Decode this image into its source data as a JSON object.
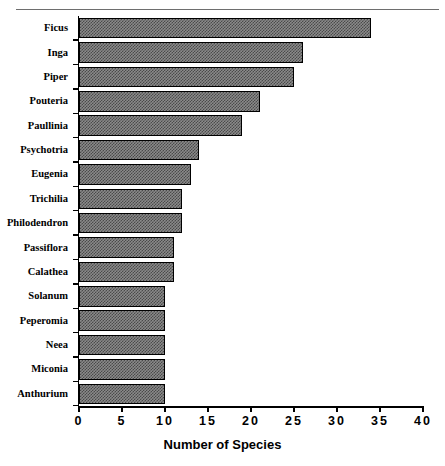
{
  "figure": {
    "top_ghost_text": "",
    "caption_ghost_text": ""
  },
  "chart_data": {
    "type": "bar",
    "orientation": "horizontal",
    "title": "",
    "xlabel": "Number of Species",
    "ylabel": "",
    "xlim": [
      0,
      40
    ],
    "xticks": [
      0,
      5,
      10,
      15,
      20,
      25,
      30,
      35,
      40
    ],
    "xtick_labels": [
      "0",
      "5",
      "10",
      "15",
      "20",
      "25",
      "30",
      "35",
      "40"
    ],
    "grid": false,
    "legend": null,
    "categories": [
      "Ficus",
      "Inga",
      "Piper",
      "Pouteria",
      "Paullinia",
      "Psychotria",
      "Eugenia",
      "Trichilia",
      "Philodendron",
      "Passiflora",
      "Calathea",
      "Solanum",
      "Peperomia",
      "Neea",
      "Miconia",
      "Anthurium"
    ],
    "values": [
      34,
      26,
      25,
      21,
      19,
      14,
      13,
      12,
      12,
      11,
      11,
      10,
      10,
      10,
      10,
      10
    ],
    "colors": {
      "bar_fill": "#8a8a8a",
      "bar_pattern": "#4a4a4a",
      "bar_border": "#000000",
      "axis": "#000000",
      "text": "#000000",
      "background": "#ffffff"
    }
  }
}
